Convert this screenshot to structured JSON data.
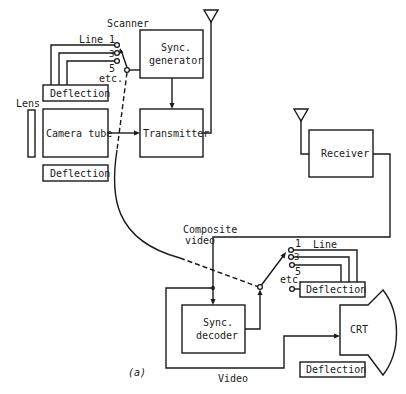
{
  "diagram": {
    "caption": "(a)",
    "transmitter_side": {
      "scanner_label": "Scanner",
      "line_label": "Line",
      "line_numbers": [
        "1",
        "3",
        "5"
      ],
      "etc_label": "etc.",
      "lens_label": "Lens",
      "deflection_top": "Deflection",
      "camera_tube": "Camera tube",
      "deflection_bottom": "Deflection",
      "sync_generator_line1": "Sync.",
      "sync_generator_line2": "generator",
      "transmitter": "Transmitter"
    },
    "receiver_side": {
      "receiver": "Receiver",
      "composite_video_line1": "Composite",
      "composite_video_line2": "video",
      "sync_decoder_line1": "Sync.",
      "sync_decoder_line2": "decoder",
      "line_label": "Line",
      "line_numbers": [
        "1",
        "3",
        "5"
      ],
      "etc_label": "etc.",
      "deflection_upper": "Deflection",
      "crt": "CRT",
      "deflection_lower": "Deflection",
      "video_label": "Video"
    },
    "colors": {
      "ink": "#1a1a1a",
      "background": "#ffffff"
    }
  }
}
